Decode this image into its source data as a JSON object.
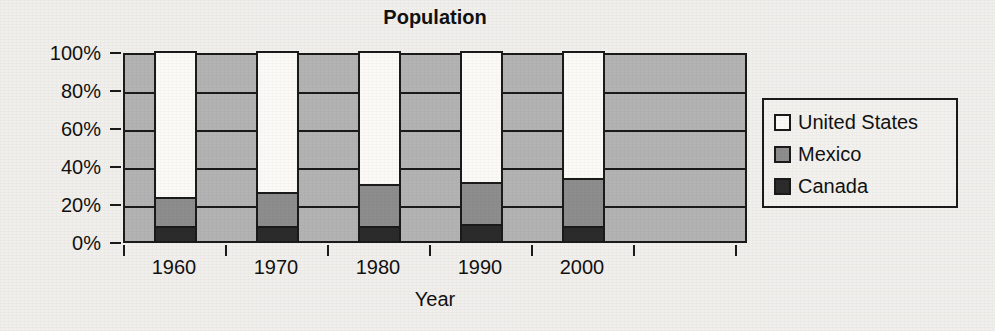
{
  "chart_data": {
    "type": "bar",
    "subtype": "stacked-100-percent",
    "title": "Population",
    "xlabel": "Year",
    "ylabel": "",
    "categories": [
      "1960",
      "1970",
      "1980",
      "1990",
      "2000"
    ],
    "ytick_labels": [
      "0%",
      "20%",
      "40%",
      "60%",
      "80%",
      "100%"
    ],
    "ytick_values": [
      0,
      20,
      40,
      60,
      80,
      100
    ],
    "ylim": [
      0,
      100
    ],
    "grid": true,
    "legend_position": "right",
    "series": [
      {
        "name": "Canada",
        "color": "#2b2b2b",
        "values": [
          8,
          8,
          8,
          9,
          8
        ]
      },
      {
        "name": "Mexico",
        "color": "#8d8d8d",
        "values": [
          15,
          18,
          22,
          22,
          25
        ]
      },
      {
        "name": "United States",
        "color": "#fbfaf7",
        "values": [
          77,
          74,
          70,
          69,
          67
        ]
      }
    ],
    "cumulative_tops": {
      "canada": [
        8,
        8,
        8,
        9,
        8
      ],
      "mexico": [
        23,
        26,
        30,
        31,
        33
      ],
      "united_states": [
        100,
        100,
        100,
        100,
        100
      ]
    }
  },
  "legend": {
    "items": [
      {
        "label": "United States",
        "swatch": "white-swatch-icon"
      },
      {
        "label": "Mexico",
        "swatch": "gray-swatch-icon"
      },
      {
        "label": "Canada",
        "swatch": "dark-swatch-icon"
      }
    ]
  },
  "colors": {
    "plot_background": "#b3b3b3",
    "page_background": "#f1efec",
    "axis": "#1a1a1a",
    "united_states": "#fbfaf7",
    "mexico": "#8d8d8d",
    "canada": "#2b2b2b"
  }
}
